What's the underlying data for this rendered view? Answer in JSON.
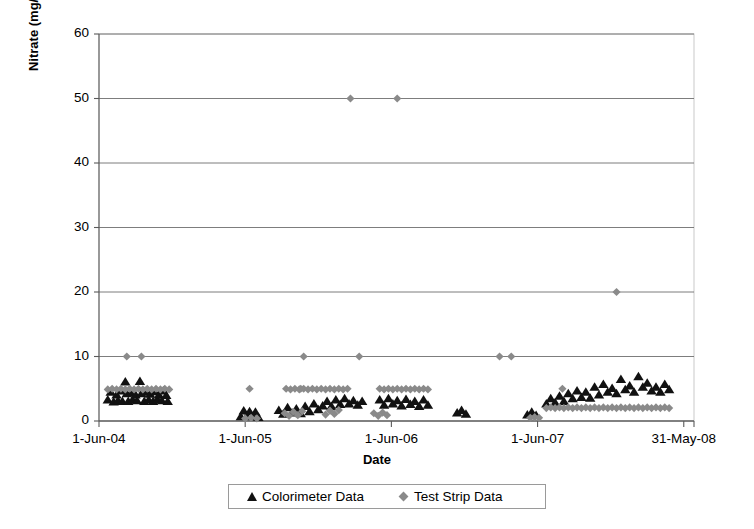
{
  "chart_data": {
    "type": "scatter",
    "title": "",
    "xlabel": "Date",
    "ylabel": "Nitrate (mg/l NO3-N)",
    "ylabel_parts": {
      "prefix": "Nitrate (mg/l NO",
      "sub": "3",
      "suffix": "-N)"
    },
    "ylim": [
      0,
      60
    ],
    "yticks": [
      0,
      10,
      20,
      30,
      40,
      50,
      60
    ],
    "ytick_labels": [
      "0",
      "10",
      "20",
      "30",
      "40",
      "50",
      "60"
    ],
    "xtick_labels": [
      "1-Jun-04",
      "1-Jun-05",
      "1-Jun-06",
      "1-Jun-07",
      "31-May-08"
    ],
    "xtick_positions": [
      0,
      1,
      2,
      3,
      4
    ],
    "xlim": [
      0,
      4.07
    ],
    "grid": "horizontal",
    "legend_position": "bottom",
    "series": [
      {
        "name": "Colorimeter Data",
        "marker": "triangle",
        "color": "#111111",
        "points": [
          [
            0.06,
            3.2
          ],
          [
            0.08,
            4.4
          ],
          [
            0.1,
            2.9
          ],
          [
            0.12,
            4.0
          ],
          [
            0.13,
            3.1
          ],
          [
            0.15,
            4.6
          ],
          [
            0.16,
            3.0
          ],
          [
            0.18,
            6.0
          ],
          [
            0.19,
            4.2
          ],
          [
            0.2,
            3.0
          ],
          [
            0.22,
            4.3
          ],
          [
            0.23,
            3.2
          ],
          [
            0.25,
            4.0
          ],
          [
            0.26,
            3.1
          ],
          [
            0.28,
            6.1
          ],
          [
            0.29,
            4.2
          ],
          [
            0.31,
            3.0
          ],
          [
            0.32,
            4.4
          ],
          [
            0.34,
            3.2
          ],
          [
            0.35,
            4.1
          ],
          [
            0.37,
            3.0
          ],
          [
            0.38,
            4.5
          ],
          [
            0.4,
            3.3
          ],
          [
            0.41,
            4.0
          ],
          [
            0.43,
            3.1
          ],
          [
            0.44,
            4.6
          ],
          [
            0.46,
            3.9
          ],
          [
            0.47,
            3.0
          ],
          [
            0.97,
            0.6
          ],
          [
            0.99,
            1.5
          ],
          [
            1.01,
            0.7
          ],
          [
            1.03,
            1.4
          ],
          [
            1.05,
            0.6
          ],
          [
            1.07,
            1.3
          ],
          [
            1.09,
            0.5
          ],
          [
            1.23,
            1.6
          ],
          [
            1.26,
            1.0
          ],
          [
            1.29,
            2.0
          ],
          [
            1.32,
            1.2
          ],
          [
            1.35,
            1.8
          ],
          [
            1.38,
            1.1
          ],
          [
            1.41,
            2.2
          ],
          [
            1.44,
            1.4
          ],
          [
            1.47,
            2.6
          ],
          [
            1.5,
            1.7
          ],
          [
            1.53,
            2.3
          ],
          [
            1.56,
            3.0
          ],
          [
            1.59,
            2.2
          ],
          [
            1.62,
            3.2
          ],
          [
            1.65,
            2.5
          ],
          [
            1.68,
            3.4
          ],
          [
            1.71,
            2.6
          ],
          [
            1.74,
            3.1
          ],
          [
            1.77,
            2.4
          ],
          [
            1.8,
            3.0
          ],
          [
            1.92,
            3.2
          ],
          [
            1.95,
            2.4
          ],
          [
            1.98,
            3.4
          ],
          [
            2.01,
            2.6
          ],
          [
            2.04,
            3.1
          ],
          [
            2.07,
            2.3
          ],
          [
            2.1,
            3.3
          ],
          [
            2.13,
            2.5
          ],
          [
            2.16,
            3.0
          ],
          [
            2.19,
            2.2
          ],
          [
            2.22,
            3.2
          ],
          [
            2.25,
            2.4
          ],
          [
            2.45,
            1.2
          ],
          [
            2.48,
            1.6
          ],
          [
            2.51,
            1.0
          ],
          [
            2.93,
            0.9
          ],
          [
            2.96,
            1.3
          ],
          [
            2.99,
            0.8
          ],
          [
            3.06,
            2.6
          ],
          [
            3.09,
            3.4
          ],
          [
            3.12,
            2.8
          ],
          [
            3.15,
            3.8
          ],
          [
            3.18,
            3.0
          ],
          [
            3.21,
            4.2
          ],
          [
            3.24,
            3.4
          ],
          [
            3.27,
            4.6
          ],
          [
            3.3,
            3.6
          ],
          [
            3.33,
            4.4
          ],
          [
            3.36,
            3.5
          ],
          [
            3.39,
            5.2
          ],
          [
            3.42,
            4.0
          ],
          [
            3.45,
            5.6
          ],
          [
            3.48,
            4.4
          ],
          [
            3.51,
            5.0
          ],
          [
            3.54,
            4.2
          ],
          [
            3.57,
            6.4
          ],
          [
            3.6,
            4.8
          ],
          [
            3.63,
            5.4
          ],
          [
            3.66,
            4.4
          ],
          [
            3.69,
            6.8
          ],
          [
            3.72,
            5.2
          ],
          [
            3.75,
            5.8
          ],
          [
            3.78,
            4.6
          ],
          [
            3.81,
            5.2
          ],
          [
            3.84,
            4.4
          ],
          [
            3.87,
            5.6
          ],
          [
            3.9,
            4.8
          ]
        ]
      },
      {
        "name": "Test Strip Data",
        "marker": "diamond",
        "color": "#8a8a8a",
        "points": [
          [
            0.19,
            10.0
          ],
          [
            0.29,
            10.0
          ],
          [
            1.4,
            10.0
          ],
          [
            1.78,
            10.0
          ],
          [
            2.74,
            10.0
          ],
          [
            2.82,
            10.0
          ],
          [
            1.72,
            50.0
          ],
          [
            2.04,
            50.0
          ],
          [
            3.54,
            20.0
          ],
          [
            1.03,
            5.0
          ],
          [
            1.38,
            5.0
          ],
          [
            3.17,
            5.0
          ],
          [
            0.06,
            4.9
          ],
          [
            0.09,
            5.0
          ],
          [
            0.12,
            4.9
          ],
          [
            0.15,
            5.0
          ],
          [
            0.18,
            4.9
          ],
          [
            0.21,
            5.0
          ],
          [
            0.24,
            4.9
          ],
          [
            0.27,
            5.0
          ],
          [
            0.3,
            4.9
          ],
          [
            0.33,
            5.0
          ],
          [
            0.36,
            4.9
          ],
          [
            0.39,
            5.0
          ],
          [
            0.42,
            4.9
          ],
          [
            0.45,
            5.0
          ],
          [
            0.48,
            4.9
          ],
          [
            1.28,
            5.0
          ],
          [
            1.31,
            4.9
          ],
          [
            1.34,
            5.0
          ],
          [
            1.37,
            4.9
          ],
          [
            1.4,
            5.0
          ],
          [
            1.43,
            4.9
          ],
          [
            1.46,
            5.0
          ],
          [
            1.49,
            4.9
          ],
          [
            1.52,
            5.0
          ],
          [
            1.55,
            4.9
          ],
          [
            1.58,
            5.0
          ],
          [
            1.61,
            4.9
          ],
          [
            1.64,
            5.0
          ],
          [
            1.67,
            4.9
          ],
          [
            1.7,
            5.0
          ],
          [
            1.92,
            5.0
          ],
          [
            1.95,
            4.9
          ],
          [
            1.98,
            5.0
          ],
          [
            2.01,
            4.9
          ],
          [
            2.04,
            5.0
          ],
          [
            2.07,
            4.9
          ],
          [
            2.1,
            5.0
          ],
          [
            2.13,
            4.9
          ],
          [
            2.16,
            5.0
          ],
          [
            2.19,
            4.9
          ],
          [
            2.22,
            5.0
          ],
          [
            2.25,
            4.9
          ],
          [
            1.0,
            0.4
          ],
          [
            1.04,
            0.5
          ],
          [
            1.08,
            0.4
          ],
          [
            1.27,
            1.2
          ],
          [
            1.3,
            0.8
          ],
          [
            1.33,
            1.4
          ],
          [
            1.36,
            0.9
          ],
          [
            1.39,
            1.5
          ],
          [
            1.55,
            1.0
          ],
          [
            1.58,
            1.6
          ],
          [
            1.61,
            1.1
          ],
          [
            1.64,
            1.7
          ],
          [
            1.88,
            1.2
          ],
          [
            1.91,
            0.8
          ],
          [
            1.94,
            1.3
          ],
          [
            1.97,
            0.9
          ],
          [
            2.95,
            0.5
          ],
          [
            2.98,
            0.6
          ],
          [
            3.01,
            0.5
          ],
          [
            3.06,
            2.0
          ],
          [
            3.09,
            2.1
          ],
          [
            3.12,
            2.0
          ],
          [
            3.15,
            2.1
          ],
          [
            3.18,
            2.0
          ],
          [
            3.21,
            2.1
          ],
          [
            3.24,
            2.0
          ],
          [
            3.27,
            2.1
          ],
          [
            3.3,
            2.0
          ],
          [
            3.33,
            2.1
          ],
          [
            3.36,
            2.0
          ],
          [
            3.39,
            2.1
          ],
          [
            3.42,
            2.0
          ],
          [
            3.45,
            2.1
          ],
          [
            3.48,
            2.0
          ],
          [
            3.51,
            2.1
          ],
          [
            3.54,
            2.0
          ],
          [
            3.57,
            2.1
          ],
          [
            3.6,
            2.0
          ],
          [
            3.63,
            2.1
          ],
          [
            3.66,
            2.0
          ],
          [
            3.69,
            2.1
          ],
          [
            3.72,
            2.0
          ],
          [
            3.75,
            2.1
          ],
          [
            3.78,
            2.0
          ],
          [
            3.81,
            2.1
          ],
          [
            3.84,
            2.0
          ],
          [
            3.87,
            2.1
          ],
          [
            3.9,
            2.0
          ]
        ]
      }
    ]
  },
  "legend": {
    "items": [
      {
        "label": "Colorimeter Data",
        "marker": "triangle-marker"
      },
      {
        "label": "Test Strip Data",
        "marker": "diamond-marker"
      }
    ]
  }
}
